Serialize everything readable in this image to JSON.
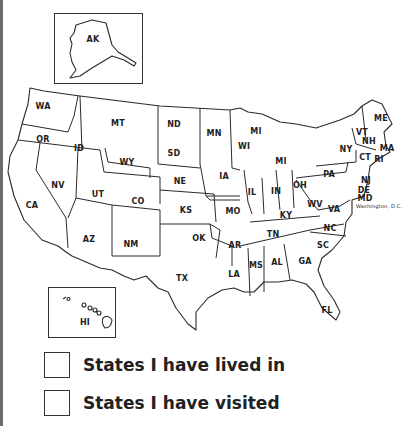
{
  "map": {
    "title": "United States map",
    "insets": {
      "alaska": "AK",
      "hawaii": "HI"
    },
    "states": [
      {
        "code": "WA",
        "x": 43,
        "y": 106
      },
      {
        "code": "OR",
        "x": 43,
        "y": 139
      },
      {
        "code": "ID",
        "x": 79,
        "y": 148
      },
      {
        "code": "MT",
        "x": 118,
        "y": 123
      },
      {
        "code": "ND",
        "x": 174,
        "y": 124
      },
      {
        "code": "MN",
        "x": 214,
        "y": 133
      },
      {
        "code": "WI",
        "x": 244,
        "y": 146
      },
      {
        "code": "MI",
        "x": 281,
        "y": 161
      },
      {
        "code": "MI",
        "x": 256,
        "y": 131
      },
      {
        "code": "SD",
        "x": 174,
        "y": 153
      },
      {
        "code": "WY",
        "x": 127,
        "y": 162
      },
      {
        "code": "NV",
        "x": 58,
        "y": 185
      },
      {
        "code": "UT",
        "x": 98,
        "y": 194
      },
      {
        "code": "CO",
        "x": 138,
        "y": 201
      },
      {
        "code": "NE",
        "x": 180,
        "y": 181
      },
      {
        "code": "IA",
        "x": 224,
        "y": 176
      },
      {
        "code": "IL",
        "x": 252,
        "y": 192
      },
      {
        "code": "IN",
        "x": 276,
        "y": 191
      },
      {
        "code": "OH",
        "x": 300,
        "y": 185
      },
      {
        "code": "PA",
        "x": 329,
        "y": 174
      },
      {
        "code": "NY",
        "x": 346,
        "y": 149
      },
      {
        "code": "VT",
        "x": 362,
        "y": 132
      },
      {
        "code": "NH",
        "x": 369,
        "y": 141
      },
      {
        "code": "ME",
        "x": 381,
        "y": 118
      },
      {
        "code": "MA",
        "x": 387,
        "y": 148
      },
      {
        "code": "CT",
        "x": 365,
        "y": 157
      },
      {
        "code": "RI",
        "x": 379,
        "y": 159
      },
      {
        "code": "NJ",
        "x": 366,
        "y": 180
      },
      {
        "code": "DE",
        "x": 364,
        "y": 190
      },
      {
        "code": "MD",
        "x": 365,
        "y": 198
      },
      {
        "code": "CA",
        "x": 32,
        "y": 205
      },
      {
        "code": "KS",
        "x": 186,
        "y": 210
      },
      {
        "code": "MO",
        "x": 233,
        "y": 211
      },
      {
        "code": "KY",
        "x": 286,
        "y": 215
      },
      {
        "code": "WV",
        "x": 315,
        "y": 204
      },
      {
        "code": "VA",
        "x": 334,
        "y": 209
      },
      {
        "code": "AZ",
        "x": 89,
        "y": 239
      },
      {
        "code": "NM",
        "x": 131,
        "y": 244
      },
      {
        "code": "OK",
        "x": 199,
        "y": 238
      },
      {
        "code": "AR",
        "x": 235,
        "y": 245
      },
      {
        "code": "TN",
        "x": 273,
        "y": 234
      },
      {
        "code": "NC",
        "x": 330,
        "y": 228
      },
      {
        "code": "SC",
        "x": 323,
        "y": 245
      },
      {
        "code": "TX",
        "x": 182,
        "y": 278
      },
      {
        "code": "LA",
        "x": 234,
        "y": 274
      },
      {
        "code": "MS",
        "x": 256,
        "y": 265
      },
      {
        "code": "AL",
        "x": 277,
        "y": 262
      },
      {
        "code": "GA",
        "x": 305,
        "y": 261
      },
      {
        "code": "FL",
        "x": 327,
        "y": 310
      }
    ],
    "annotation": "Washington, D.C."
  },
  "legend": {
    "items": [
      {
        "label": "States I have lived in"
      },
      {
        "label": "States I have visited"
      }
    ]
  }
}
